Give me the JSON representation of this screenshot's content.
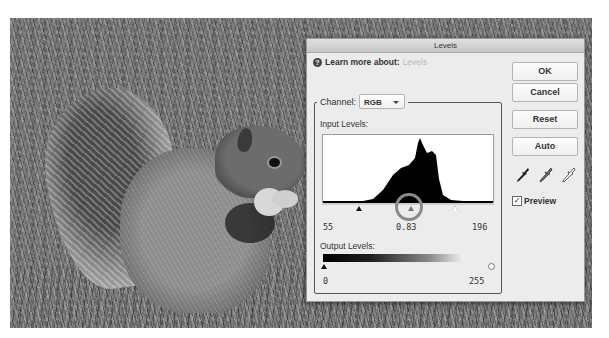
{
  "photo": {
    "subject": "grayscale squirrel on grass",
    "description": "Gray squirrel eating, sitting on lawn"
  },
  "dialog": {
    "title": "Levels",
    "learn_more_label": "Learn more about:",
    "learn_more_link": "Levels",
    "channel_label": "Channel:",
    "channel_value": "RGB",
    "input_levels_label": "Input Levels:",
    "input_black": "55",
    "input_midtone": "0.83",
    "input_white": "196",
    "output_levels_label": "Output Levels:",
    "output_black": "0",
    "output_white": "255",
    "buttons": {
      "ok": "OK",
      "cancel": "Cancel",
      "reset": "Reset",
      "auto": "Auto"
    },
    "eyedroppers": [
      "black-point",
      "gray-point",
      "white-point"
    ],
    "preview_label": "Preview",
    "preview_checked": true,
    "help_glyph": "?",
    "check_glyph": "✓"
  },
  "annotation": {
    "type": "circle",
    "target": "midtone-slider",
    "color": "#8a8a8a"
  },
  "histogram": {
    "bins_description": "Single-peak distribution concentrated in the midtones with main peak near center and secondary shoulder to the right",
    "shape_points": [
      [
        0,
        66
      ],
      [
        40,
        66
      ],
      [
        50,
        64
      ],
      [
        60,
        55
      ],
      [
        70,
        40
      ],
      [
        78,
        33
      ],
      [
        86,
        30
      ],
      [
        92,
        23
      ],
      [
        95,
        8
      ],
      [
        97,
        3
      ],
      [
        99,
        8
      ],
      [
        104,
        18
      ],
      [
        109,
        16
      ],
      [
        113,
        20
      ],
      [
        116,
        44
      ],
      [
        120,
        60
      ],
      [
        128,
        65
      ],
      [
        140,
        66
      ],
      [
        170,
        66
      ]
    ]
  }
}
